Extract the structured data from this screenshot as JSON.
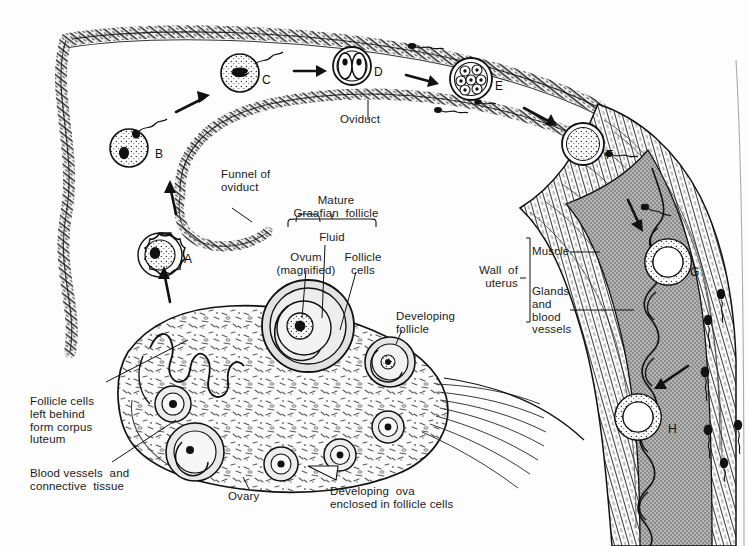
{
  "figure": {
    "type": "biological-diagram",
    "background_color": "#fdfdfd",
    "ink_color": "#111111",
    "endometrium_fill": "#b0b0b0",
    "follicle_fill": "#d9d9d9",
    "ovary_fill": "#fbfbfb"
  },
  "labels": {
    "oviduct": "Oviduct",
    "funnel_of_oviduct": "Funnel of\noviduct",
    "mature_graafian_follicle": "Mature\nGraafian  follicle",
    "fluid": "Fluid",
    "ovum_magnified": "Ovum\n(magnified)",
    "follicle_cells": "Follicle\ncells",
    "developing_follicle": "Developing\nfollicle",
    "wall_of_uterus": "Wall  of\nuterus",
    "muscle": "Muscle",
    "glands_and_blood_vessels": "Glands\nand\nblood\nvessels",
    "corpus_luteum": "Follicle cells\nleft behind\nform corpus\nluteum",
    "blood_vessels_connective_tissue": "Blood vessels  and\nconnective  tissue",
    "ovary": "Ovary",
    "developing_ova": "Developing  ova\nenclosed in follicle cells"
  },
  "stages": [
    {
      "letter": "A",
      "name": "ovum-released-from-ovary",
      "description": "Ovum just released from ovary, surrounded by follicle cells",
      "x": 184,
      "y": 253
    },
    {
      "letter": "B",
      "name": "ovum-with-sperm",
      "description": "Ovum in funnel of oviduct with sperm attached",
      "x": 155,
      "y": 148
    },
    {
      "letter": "C",
      "name": "fertilized-zygote",
      "description": "Fertilized ovum (zygote) in oviduct",
      "x": 262,
      "y": 74
    },
    {
      "letter": "D",
      "name": "two-cell-stage",
      "description": "Two-cell stage after first cleavage division",
      "x": 374,
      "y": 66
    },
    {
      "letter": "E",
      "name": "morula-stage",
      "description": "Morula — solid ball of about eight cells",
      "x": 495,
      "y": 80
    },
    {
      "letter": "F",
      "name": "blastocyst-in-oviduct",
      "description": "Many-celled blastocyst near the end of the oviduct",
      "x": 606,
      "y": 149
    },
    {
      "letter": "G",
      "name": "blastocyst-in-uterus",
      "description": "Hollow blastocyst free in the uterine cavity",
      "x": 690,
      "y": 266
    },
    {
      "letter": "H",
      "name": "implanted-embryo",
      "description": "Embryo implanted in the lining of the uterus",
      "x": 668,
      "y": 423
    }
  ],
  "annotations": {
    "sperm_present": true,
    "arrows": "Arrows show the path of the ovum from the ovary through the oviduct to the uterus, and the direction sperm travel."
  }
}
